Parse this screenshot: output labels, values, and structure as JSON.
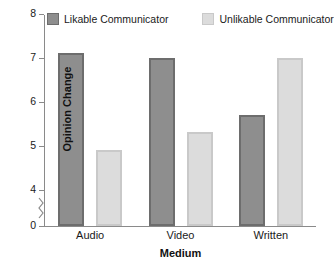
{
  "chart_data": {
    "type": "bar",
    "title": "",
    "subtitle": "",
    "xlabel": "Medium",
    "ylabel": "Opinion Change",
    "categories": [
      "Audio",
      "Video",
      "Written"
    ],
    "series": [
      {
        "name": "Likable Communicator",
        "values": [
          7.1,
          7.0,
          5.7
        ],
        "color": "#8e8e8e",
        "border_color": "#6d6d6d"
      },
      {
        "name": "Unlikable Communicator",
        "values": [
          4.9,
          5.3,
          7.0
        ],
        "color": "#dcdcdc",
        "border_color": "#c9c9c9"
      }
    ],
    "ylim": [
      0,
      8
    ],
    "y_ticks": [
      0,
      4,
      5,
      6,
      7,
      8
    ],
    "y_tick_labels": [
      "0",
      "4",
      "5",
      "6",
      "7",
      "8"
    ],
    "y_axis_break": true,
    "y_axis_break_between": [
      0,
      4
    ],
    "grid": false,
    "legend_position": "top",
    "annotations": []
  },
  "legend": {
    "entries": [
      {
        "label": "Likable Communicator",
        "swatch": "dark-gray-swatch"
      },
      {
        "label": "Unlikable Communicator",
        "swatch": "light-gray-swatch"
      }
    ]
  },
  "axes": {
    "y_title": "Opinion Change",
    "x_title": "Medium",
    "y_tick_labels": [
      "8",
      "7",
      "6",
      "5",
      "4",
      "0"
    ],
    "x_tick_labels": [
      "Audio",
      "Video",
      "Written"
    ]
  }
}
